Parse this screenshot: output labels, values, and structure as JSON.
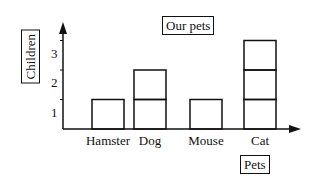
{
  "chart_data": {
    "type": "bar",
    "title": "Our pets",
    "xlabel": "Pets",
    "ylabel": "Children",
    "categories": [
      "Hamster",
      "Dog",
      "Mouse",
      "Cat"
    ],
    "values": [
      1,
      2,
      1,
      3
    ],
    "yticks": [
      "1",
      "2",
      "3"
    ],
    "ylim": [
      0,
      3.5
    ],
    "grid": false,
    "bar_style": "stacked unit squares, outlined"
  }
}
